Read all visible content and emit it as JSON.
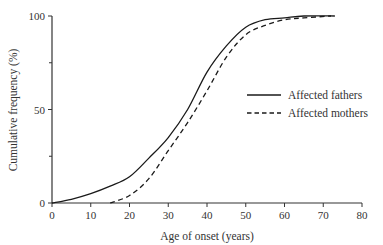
{
  "chart_data": {
    "type": "line",
    "title": "",
    "xlabel": "Age of onset (years)",
    "ylabel": "Cumulative frequency (%)",
    "xlim": [
      0,
      80
    ],
    "ylim": [
      0,
      100
    ],
    "x_ticks": [
      0,
      10,
      20,
      30,
      40,
      50,
      60,
      70,
      80
    ],
    "y_ticks": [
      0,
      50,
      100
    ],
    "y_minor_ticks": [
      25,
      75
    ],
    "grid": false,
    "legend_position": "right-middle",
    "series": [
      {
        "name": "Affected fathers",
        "style": "solid",
        "x": [
          0,
          5,
          10,
          15,
          20,
          25,
          30,
          35,
          40,
          45,
          50,
          55,
          60,
          65,
          73
        ],
        "values": [
          0,
          2,
          5,
          9,
          14,
          24,
          35,
          50,
          70,
          84,
          94,
          98,
          99,
          100,
          100
        ]
      },
      {
        "name": "Affected mothers",
        "style": "dashed",
        "x": [
          15,
          20,
          25,
          30,
          35,
          40,
          45,
          50,
          55,
          60,
          65,
          72
        ],
        "values": [
          0,
          4,
          13,
          28,
          43,
          60,
          78,
          90,
          95,
          98,
          99,
          100
        ]
      }
    ]
  },
  "colors": {
    "line": "#1a1a1a",
    "axis": "#333333",
    "background": "#ffffff"
  }
}
